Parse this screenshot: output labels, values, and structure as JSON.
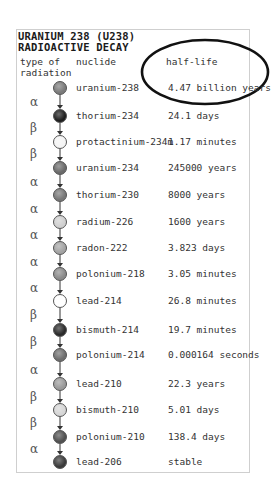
{
  "title": {
    "line1": "URANIUM 238 (U238)",
    "line2": "RADIOACTIVE DECAY"
  },
  "headers": {
    "type_line1": "type of",
    "type_line2": "radiation",
    "nuclide": "nuclide",
    "half_life": "half-life"
  },
  "symbols": {
    "alpha": "α",
    "beta": "β"
  },
  "nuclides": [
    {
      "name": "uranium-238",
      "half_life": "4.47 billion years",
      "shade": "#7a7a7a",
      "y": 88
    },
    {
      "name": "thorium-234",
      "half_life": "24.1 days",
      "shade": "#1e1e1e",
      "y": 116
    },
    {
      "name": "protactinium-234m",
      "half_life": "1.17 minutes",
      "shade": "#f4f4f4",
      "y": 142
    },
    {
      "name": "uranium-234",
      "half_life": "245000 years",
      "shade": "#6a6a6a",
      "y": 168
    },
    {
      "name": "thorium-230",
      "half_life": "8000 years",
      "shade": "#777777",
      "y": 195
    },
    {
      "name": "radium-226",
      "half_life": "1600 years",
      "shade": "#cfcfcf",
      "y": 222
    },
    {
      "name": "radon-222",
      "half_life": "3.823 days",
      "shade": "#a3a3a3",
      "y": 248
    },
    {
      "name": "polonium-218",
      "half_life": "3.05 minutes",
      "shade": "#8a8a8a",
      "y": 274
    },
    {
      "name": "lead-214",
      "half_life": "26.8 minutes",
      "shade": "#ffffff",
      "y": 301
    },
    {
      "name": "bismuth-214",
      "half_life": "19.7 minutes",
      "shade": "#2a2a2a",
      "y": 330
    },
    {
      "name": "polonium-214",
      "half_life": "0.000164 seconds",
      "shade": "#6e6e6e",
      "y": 355
    },
    {
      "name": "lead-210",
      "half_life": "22.3 years",
      "shade": "#9a9a9a",
      "y": 384
    },
    {
      "name": "bismuth-210",
      "half_life": "5.01 days",
      "shade": "#d6d6d6",
      "y": 410
    },
    {
      "name": "polonium-210",
      "half_life": "138.4 days",
      "shade": "#505050",
      "y": 437
    },
    {
      "name": "lead-206",
      "half_life": "stable",
      "shade": "#3a3a3a",
      "y": 462
    }
  ],
  "decays": [
    {
      "type": "α",
      "y": 102
    },
    {
      "type": "β",
      "y": 128
    },
    {
      "type": "β",
      "y": 154
    },
    {
      "type": "α",
      "y": 182
    },
    {
      "type": "α",
      "y": 209
    },
    {
      "type": "α",
      "y": 235
    },
    {
      "type": "α",
      "y": 262
    },
    {
      "type": "α",
      "y": 288
    },
    {
      "type": "β",
      "y": 315
    },
    {
      "type": "β",
      "y": 342
    },
    {
      "type": "α",
      "y": 370
    },
    {
      "type": "β",
      "y": 397
    },
    {
      "type": "β",
      "y": 423
    },
    {
      "type": "α",
      "y": 449
    }
  ],
  "highlight": {
    "shape": "ellipse",
    "cx": 205,
    "cy": 72,
    "rx": 63,
    "ry": 32,
    "stroke": "#111111"
  }
}
